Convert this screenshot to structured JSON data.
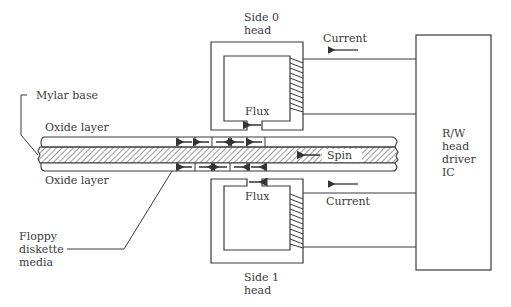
{
  "diagram": {
    "labels": {
      "side0_head": [
        "Side 0",
        "head"
      ],
      "side1_head": [
        "Side 1",
        "head"
      ],
      "current_top": "Current",
      "current_bottom": "Current",
      "flux_top": "Flux",
      "flux_bottom": "Flux",
      "mylar_base": "Mylar base",
      "oxide_top": "Oxide layer",
      "oxide_bottom": "Oxide layer",
      "spin": "Spin",
      "media": [
        "Floppy",
        "diskette",
        "media"
      ],
      "driver_ic": [
        "R/W",
        "head",
        "driver",
        "IC"
      ]
    },
    "magnetic_domains": {
      "top_row": [
        "left",
        "left",
        "right",
        "left",
        "left"
      ],
      "bottom_row": [
        "left",
        "right",
        "left",
        "right",
        "right"
      ]
    },
    "arrows": {
      "current_top_direction": "left",
      "current_bottom_direction": "left",
      "flux_top_direction": "left",
      "flux_bottom_direction": "right",
      "spin_direction": "left"
    },
    "colors": {
      "line": "#3a3a3a",
      "background": "#ffffff",
      "hatch": "#555555"
    }
  }
}
